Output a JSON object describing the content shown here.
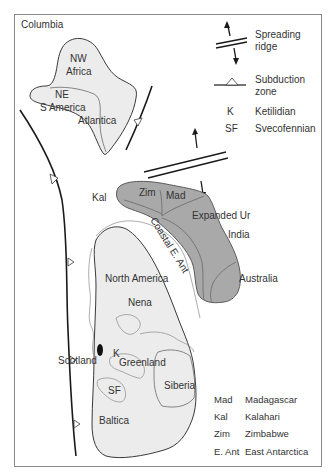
{
  "title": "Columbia",
  "legend": {
    "spreading_ridge": "Spreading ridge",
    "spreading_ridge_line1": "Spreading",
    "spreading_ridge_line2": "ridge",
    "subduction_line1": "Subduction",
    "subduction_line2": "zone",
    "abbreviations": [
      {
        "abbr": "K",
        "name": "Ketilidian"
      },
      {
        "abbr": "SF",
        "name": "Svecofennian"
      }
    ],
    "continent_abbreviations": [
      {
        "abbr": "Mad",
        "name": "Madagascar"
      },
      {
        "abbr": "Kal",
        "name": "Kalahari"
      },
      {
        "abbr": "Zim",
        "name": "Zimbabwe"
      },
      {
        "abbr": "E. Ant",
        "name": "East Antarctica"
      }
    ]
  },
  "regions": {
    "nw_africa_1": "NW",
    "nw_africa_2": "Africa",
    "ne_s_america_1": "NE",
    "ne_s_america_2": "S America",
    "atlantica": "Atlantica",
    "kal": "Kal",
    "zim": "Zim",
    "mad": "Mad",
    "expanded_ur": "Expanded Ur",
    "india": "India",
    "australia": "Australia",
    "coastal_e_ant": "Coastal E. Ant",
    "north_america": "North America",
    "nena": "Nena",
    "scotland": "Scotland",
    "k": "K",
    "greenland": "Greenland",
    "sf": "SF",
    "siberia": "Siberia",
    "baltica": "Baltica"
  },
  "colors": {
    "light_continent": "#ececec",
    "dark_continent": "#a9a9a9",
    "line": "#1a1a1a"
  }
}
